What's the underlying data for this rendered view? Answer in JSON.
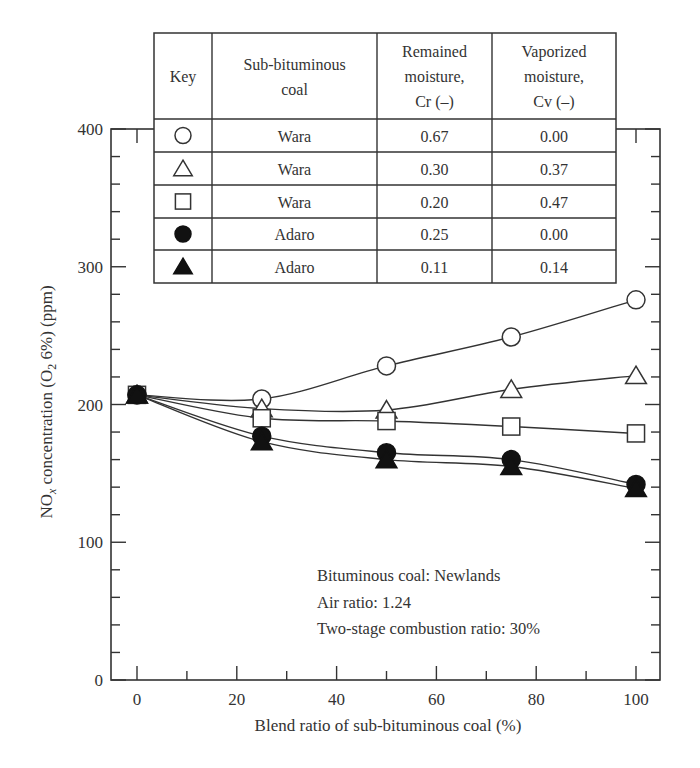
{
  "chart_data": {
    "type": "line",
    "title": "",
    "xlabel": "Blend ratio of sub-bituminous coal (%)",
    "ylabel": "NOx concentration (O2 6%) (ppm)",
    "ylabel_parts": {
      "pre": "NO",
      "sub1": "x",
      "mid": " concentration (O",
      "sub2": "2",
      "post": " 6%) (ppm)"
    },
    "xlim": [
      -5,
      105
    ],
    "ylim": [
      0,
      400
    ],
    "x_ticks": [
      0,
      20,
      40,
      60,
      80,
      100
    ],
    "x_tick_labels": [
      "0",
      "20",
      "40",
      "60",
      "80",
      "100"
    ],
    "y_ticks": [
      0,
      100,
      200,
      300,
      400
    ],
    "y_tick_labels": [
      "0",
      "100",
      "200",
      "300",
      "400"
    ],
    "grid": false,
    "x": [
      0,
      25,
      50,
      75,
      100
    ],
    "series": [
      {
        "name": "Wara, Cr 0.67, Cv 0.00",
        "marker": "circle-open",
        "values": [
          207,
          204,
          228,
          249,
          276
        ]
      },
      {
        "name": "Wara, Cr 0.30, Cv 0.37",
        "marker": "triangle-open",
        "values": [
          207,
          197,
          196,
          211,
          221
        ]
      },
      {
        "name": "Wara, Cr 0.20, Cv 0.47",
        "marker": "square-open",
        "values": [
          207,
          190,
          188,
          184,
          179
        ]
      },
      {
        "name": "Adaro, Cr 0.25, Cv 0.00",
        "marker": "circle-filled",
        "values": [
          207,
          177,
          165,
          160,
          142
        ]
      },
      {
        "name": "Adaro, Cr 0.11, Cv 0.14",
        "marker": "triangle-filled",
        "values": [
          207,
          173,
          160,
          155,
          139
        ]
      }
    ],
    "legend": {
      "position": "top-inside-table",
      "headers": [
        "Key",
        "Sub-bituminous coal",
        "Remained moisture, Cr (–)",
        "Vaporized moisture, Cv (–)"
      ],
      "header_lines": [
        [
          "Key"
        ],
        [
          "Sub-bituminous",
          "coal"
        ],
        [
          "Remained",
          "moisture,",
          "Cr (–)"
        ],
        [
          "Vaporized",
          "moisture,",
          "Cv (–)"
        ]
      ],
      "rows": [
        {
          "key": "circle-open",
          "coal": "Wara",
          "cr": "0.67",
          "cv": "0.00"
        },
        {
          "key": "triangle-open",
          "coal": "Wara",
          "cr": "0.30",
          "cv": "0.37"
        },
        {
          "key": "square-open",
          "coal": "Wara",
          "cr": "0.20",
          "cv": "0.47"
        },
        {
          "key": "circle-filled",
          "coal": "Adaro",
          "cr": "0.25",
          "cv": "0.00"
        },
        {
          "key": "triangle-filled",
          "coal": "Adaro",
          "cr": "0.11",
          "cv": "0.14"
        }
      ]
    },
    "annotations": [
      "Bituminous coal: Newlands",
      "Air ratio: 1.24",
      "Two-stage combustion ratio: 30%"
    ],
    "colors": {
      "line": "#333333",
      "marker_fill": "#111111",
      "frame": "#333333"
    }
  }
}
